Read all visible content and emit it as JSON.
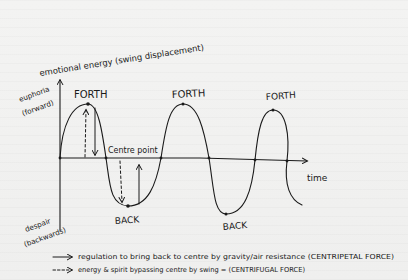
{
  "diagram": {
    "y_axis_label": "emotional energy (swing displacement)",
    "y_top_label_line1": "euphoria",
    "y_top_label_line2": "(forward)",
    "y_bottom_label_line1": "despair",
    "y_bottom_label_line2": "(backwards)",
    "x_axis_label": "time",
    "centre_label": "Centre point",
    "peaks": [
      "FORTH",
      "FORTH",
      "FORTH"
    ],
    "troughs": [
      "BACK",
      "BACK"
    ],
    "legend": [
      {
        "style": "solid",
        "text": "regulation to bring back to centre by gravity/air resistance (CENTRIPETAL FORCE)"
      },
      {
        "style": "dashed",
        "text": "energy & spirit bypassing centre by swing = (CENTRIFUGAL FORCE)"
      }
    ],
    "colors": {
      "ink": "#1a1a1a",
      "paper": "#f1f1f0"
    }
  }
}
